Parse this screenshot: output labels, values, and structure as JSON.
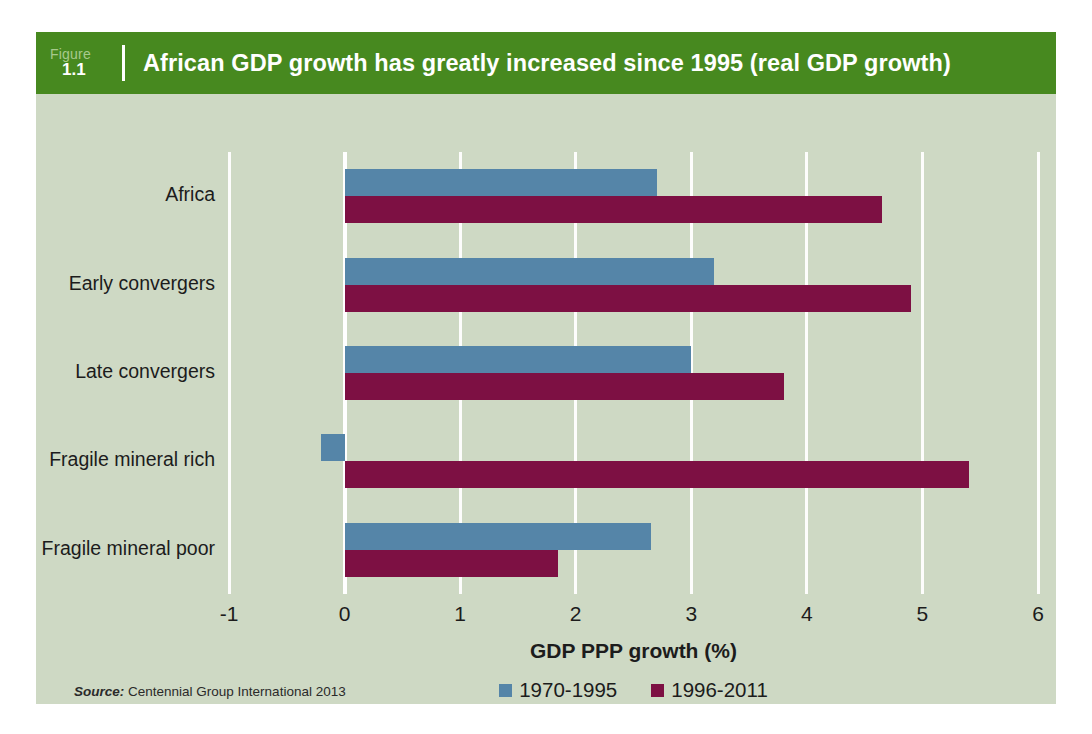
{
  "figure": {
    "label_word": "Figure",
    "number": "1.1",
    "title": "African GDP growth has greatly increased since 1995 (real GDP growth)",
    "header_color": "#47891f",
    "panel_color": "#ced9c4"
  },
  "source": {
    "prefix": "Source:",
    "text": "Centennial Group International 2013"
  },
  "legend": {
    "items": [
      {
        "label": "1970-1995",
        "color": "#5585a8"
      },
      {
        "label": "1996-2011",
        "color": "#7d1043"
      }
    ]
  },
  "chart_data": {
    "type": "bar",
    "orientation": "horizontal",
    "title": "African GDP growth has greatly increased since 1995 (real GDP growth)",
    "xlabel": "GDP PPP growth (%)",
    "ylabel": "",
    "xlim": [
      -1,
      6
    ],
    "xticks": [
      -1,
      0,
      1,
      2,
      3,
      4,
      5,
      6
    ],
    "xtick_labels": [
      "-1",
      "0",
      "1",
      "2",
      "3",
      "4",
      "5",
      "6"
    ],
    "grid": true,
    "grid_axis": "x",
    "legend_position": "bottom-center",
    "categories": [
      "Africa",
      "Early convergers",
      "Late convergers",
      "Fragile mineral rich",
      "Fragile mineral poor"
    ],
    "series": [
      {
        "name": "1970-1995",
        "color": "#5585a8",
        "values": [
          2.7,
          3.2,
          3.0,
          -0.2,
          2.65
        ]
      },
      {
        "name": "1996-2011",
        "color": "#7d1043",
        "values": [
          4.65,
          4.9,
          3.8,
          5.4,
          1.85
        ]
      }
    ]
  }
}
